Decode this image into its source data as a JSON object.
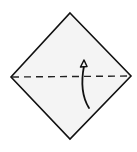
{
  "diagram": {
    "type": "origami-step",
    "paper": {
      "shape": "square-rotated-45",
      "fill": "#f4f4f4",
      "stroke": "#111111",
      "vertices": {
        "top": [
          70,
          13
        ],
        "right": [
          131,
          76
        ],
        "bottom": [
          70,
          139
        ],
        "left": [
          11,
          77
        ]
      }
    },
    "fold_line": {
      "style": "dashed",
      "kind": "valley-fold",
      "from": [
        11,
        77
      ],
      "to": [
        131,
        76
      ],
      "color": "#222222"
    },
    "arrow": {
      "direction": "up",
      "path": "M 89 108 Q 79 90 84 64",
      "head": [
        84,
        61
      ],
      "color": "#111111"
    }
  }
}
